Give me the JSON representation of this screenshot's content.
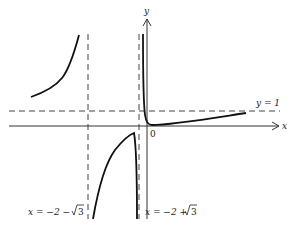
{
  "diagram": {
    "type": "function-graph",
    "axes": {
      "x_label": "x",
      "y_label": "y",
      "origin_label": "0"
    },
    "asymptotes": {
      "horizontal": {
        "label": "y = 1"
      },
      "vertical_left": {
        "label_prefix": "x = −2 − ",
        "label_root": "3"
      },
      "vertical_right": {
        "label_prefix": "x = −2 + ",
        "label_root": "3"
      }
    },
    "colors": {
      "curve": "#111111",
      "axis": "#333333",
      "asymptote": "#444444",
      "background": "#ffffff"
    }
  }
}
